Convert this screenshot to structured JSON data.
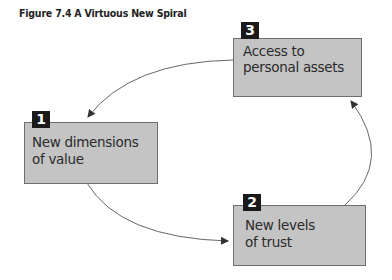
{
  "figure": {
    "title": "Figure 7.4 A Virtuous New Spiral"
  },
  "nodes": [
    {
      "number": "1",
      "line1": "New dimensions",
      "line2": "of value"
    },
    {
      "number": "2",
      "line1": "New levels",
      "line2": "of trust"
    },
    {
      "number": "3",
      "line1": "Access to",
      "line2": "personal assets"
    }
  ],
  "edges": [
    {
      "from": "1",
      "to": "2"
    },
    {
      "from": "2",
      "to": "3"
    },
    {
      "from": "3",
      "to": "1"
    }
  ],
  "colors": {
    "box_fill": "#c4c4c4",
    "box_border": "#6e6e6e",
    "badge": "#1a1a1a",
    "arrow": "#444444"
  }
}
